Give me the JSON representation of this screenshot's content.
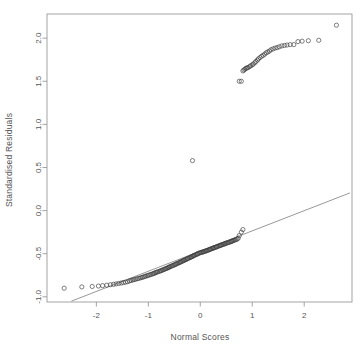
{
  "figure": {
    "width": 364,
    "height": 349,
    "background": "#ffffff",
    "foreground": "#555555",
    "point_color": "#3a3a3a",
    "line_color": "#6b6b6b",
    "frame_color": "#9a9a9a",
    "title": ""
  },
  "chart_data": {
    "type": "scatter",
    "title": "",
    "subtitle": "",
    "xlabel": "Normal Scores",
    "ylabel": "Standardised Residuals",
    "xlim": [
      -2.95,
      2.92
    ],
    "ylim": [
      -1.06,
      2.28
    ],
    "xticks": [
      -2,
      -1,
      0,
      1,
      2
    ],
    "xticklabels": [
      "-2",
      "-1",
      "0",
      "1",
      "2"
    ],
    "yticks": [
      -1.0,
      -0.5,
      0.0,
      0.5,
      1.0,
      1.5,
      2.0
    ],
    "yticklabels": [
      "-1.0",
      "-0.5",
      "0.0",
      "0.5",
      "1.0",
      "1.5",
      "2.0"
    ],
    "grid": false,
    "legend": null,
    "marker": "open-circle",
    "marker_size": 2.1,
    "reference_line": {
      "label": "qq reference line",
      "x": [
        -2.48,
        2.88
      ],
      "y": [
        -1.05,
        0.205
      ]
    },
    "series": [
      {
        "name": "Standardised residuals vs normal scores",
        "x": [
          -2.62,
          -2.28,
          -2.08,
          -1.96,
          -1.88,
          -1.8,
          -1.73,
          -1.67,
          -1.62,
          -1.57,
          -1.52,
          -1.48,
          -1.44,
          -1.4,
          -1.36,
          -1.33,
          -1.3,
          -1.27,
          -1.24,
          -1.21,
          -1.18,
          -1.15,
          -1.12,
          -1.1,
          -1.07,
          -1.05,
          -1.02,
          -1.0,
          -0.97,
          -0.95,
          -0.92,
          -0.9,
          -0.88,
          -0.86,
          -0.84,
          -0.82,
          -0.79,
          -0.77,
          -0.75,
          -0.73,
          -0.71,
          -0.69,
          -0.67,
          -0.65,
          -0.63,
          -0.61,
          -0.6,
          -0.58,
          -0.56,
          -0.54,
          -0.52,
          -0.5,
          -0.48,
          -0.47,
          -0.45,
          -0.43,
          -0.41,
          -0.39,
          -0.38,
          -0.36,
          -0.34,
          -0.32,
          -0.31,
          -0.29,
          -0.27,
          -0.25,
          -0.24,
          -0.22,
          -0.2,
          -0.18,
          -0.17,
          -0.15,
          -0.13,
          -0.12,
          -0.1,
          -0.08,
          -0.06,
          -0.05,
          -0.03,
          -0.01,
          0.01,
          0.03,
          0.05,
          0.06,
          0.08,
          0.1,
          0.12,
          0.13,
          0.15,
          0.17,
          0.18,
          0.2,
          0.22,
          0.24,
          0.25,
          0.27,
          0.29,
          0.31,
          0.32,
          0.34,
          0.36,
          0.38,
          0.39,
          0.41,
          0.43,
          0.45,
          0.47,
          0.48,
          0.5,
          0.52,
          0.54,
          0.56,
          0.58,
          0.6,
          0.61,
          0.63,
          0.65,
          0.67,
          0.69,
          0.71,
          0.73,
          0.75,
          0.79,
          0.82,
          -0.15,
          0.75,
          0.79,
          0.82,
          0.84,
          0.86,
          0.88,
          0.9,
          0.92,
          0.95,
          0.97,
          1.0,
          1.02,
          1.05,
          1.07,
          1.1,
          1.12,
          1.15,
          1.18,
          1.21,
          1.24,
          1.27,
          1.3,
          1.33,
          1.36,
          1.4,
          1.44,
          1.48,
          1.52,
          1.57,
          1.62,
          1.67,
          1.73,
          1.8,
          1.88,
          1.96,
          2.08,
          2.28,
          2.62
        ],
        "y": [
          -0.9,
          -0.885,
          -0.88,
          -0.875,
          -0.87,
          -0.865,
          -0.86,
          -0.855,
          -0.85,
          -0.845,
          -0.84,
          -0.835,
          -0.83,
          -0.825,
          -0.815,
          -0.81,
          -0.805,
          -0.8,
          -0.795,
          -0.79,
          -0.785,
          -0.78,
          -0.775,
          -0.77,
          -0.765,
          -0.76,
          -0.755,
          -0.75,
          -0.745,
          -0.74,
          -0.735,
          -0.73,
          -0.725,
          -0.72,
          -0.715,
          -0.71,
          -0.705,
          -0.7,
          -0.695,
          -0.69,
          -0.685,
          -0.68,
          -0.675,
          -0.67,
          -0.665,
          -0.66,
          -0.655,
          -0.65,
          -0.645,
          -0.64,
          -0.635,
          -0.63,
          -0.625,
          -0.62,
          -0.615,
          -0.61,
          -0.605,
          -0.6,
          -0.595,
          -0.59,
          -0.585,
          -0.58,
          -0.575,
          -0.57,
          -0.565,
          -0.56,
          -0.555,
          -0.55,
          -0.545,
          -0.54,
          -0.535,
          -0.53,
          -0.525,
          -0.52,
          -0.515,
          -0.51,
          -0.505,
          -0.5,
          -0.495,
          -0.49,
          -0.487,
          -0.484,
          -0.48,
          -0.477,
          -0.473,
          -0.47,
          -0.466,
          -0.462,
          -0.458,
          -0.455,
          -0.45,
          -0.446,
          -0.442,
          -0.438,
          -0.434,
          -0.43,
          -0.426,
          -0.422,
          -0.418,
          -0.414,
          -0.41,
          -0.406,
          -0.402,
          -0.398,
          -0.394,
          -0.39,
          -0.386,
          -0.382,
          -0.378,
          -0.374,
          -0.37,
          -0.366,
          -0.362,
          -0.358,
          -0.354,
          -0.35,
          -0.345,
          -0.34,
          -0.335,
          -0.33,
          -0.32,
          -0.29,
          -0.25,
          -0.22,
          0.58,
          1.5,
          1.5,
          1.62,
          1.63,
          1.64,
          1.65,
          1.655,
          1.66,
          1.67,
          1.68,
          1.69,
          1.7,
          1.715,
          1.73,
          1.745,
          1.76,
          1.775,
          1.79,
          1.8,
          1.815,
          1.83,
          1.84,
          1.85,
          1.865,
          1.875,
          1.885,
          1.89,
          1.9,
          1.91,
          1.915,
          1.92,
          1.925,
          1.925,
          1.96,
          1.965,
          1.97,
          1.975,
          2.15
        ]
      }
    ]
  },
  "labels": {
    "x_axis_title": "Normal Scores",
    "y_axis_title": "Standardised Residuals"
  }
}
